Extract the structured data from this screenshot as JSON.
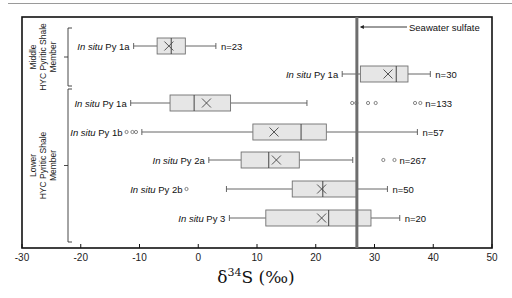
{
  "chart_data": {
    "type": "boxplot",
    "orientation": "horizontal",
    "title": "",
    "xlabel": "δ34S (‰)",
    "xlabel_parts": {
      "delta": "δ",
      "sup": "34",
      "rest": "S (‰)"
    },
    "ylabel": "",
    "xlim": [
      -30,
      50
    ],
    "xticks": [
      -30,
      -20,
      -10,
      0,
      10,
      20,
      30,
      40,
      50
    ],
    "grid": false,
    "reference_line": {
      "label": "Seawater sulfate",
      "x": 27
    },
    "groups": [
      {
        "label_lines": [
          "Middle",
          "HYC Pyritic Shale",
          "Member"
        ],
        "rows": [
          0,
          1
        ]
      },
      {
        "label_lines": [
          "Lower",
          "HYC Pyritic Shale",
          "Member"
        ],
        "rows": [
          2,
          3,
          4,
          5,
          6
        ]
      }
    ],
    "series": [
      {
        "name_italic": "In situ",
        "name_rest": " Py 1a",
        "group": "Middle",
        "n_label": "n=23",
        "whisker_low": -11,
        "q1": -7,
        "median": -4.6,
        "q3": -2.2,
        "whisker_high": 3,
        "mean": -5,
        "outliers": []
      },
      {
        "name_italic": "In situ",
        "name_rest": " Py 1a",
        "group": "Middle",
        "n_label": "n=30",
        "whisker_low": 24.5,
        "q1": 27.6,
        "median": 33.7,
        "q3": 35.7,
        "whisker_high": 39.5,
        "mean": 32.3,
        "outliers": []
      },
      {
        "name_italic": "In situ",
        "name_rest": " Py 1a",
        "group": "Lower",
        "n_label": "n=133",
        "whisker_low": -11.5,
        "q1": -4.8,
        "median": -0.7,
        "q3": 5.5,
        "whisker_high": 18.5,
        "mean": 1.4,
        "outliers": [
          26.2,
          26.9,
          28.9,
          30.2,
          36.9,
          37.8
        ]
      },
      {
        "name_italic": "In situ",
        "name_rest": " Py 1b",
        "group": "Lower",
        "n_label": "n=57",
        "whisker_low": -9.6,
        "q1": 9.3,
        "median": 17.5,
        "q3": 21.8,
        "whisker_high": 37.3,
        "mean": 12.9,
        "outliers": [
          -12.2,
          -11.2,
          -10.6
        ]
      },
      {
        "name_italic": "In situ",
        "name_rest": " Py 2a",
        "group": "Lower",
        "n_label": "n=267",
        "whisker_low": 1.8,
        "q1": 7.3,
        "median": 12.0,
        "q3": 17.2,
        "whisker_high": 26.3,
        "mean": 13.3,
        "outliers": [
          31.5,
          33.4
        ]
      },
      {
        "name_italic": "In situ",
        "name_rest": " Py 2b",
        "group": "Lower",
        "n_label": "n=50",
        "whisker_low": 4.8,
        "q1": 16.0,
        "median": 21.2,
        "q3": 27.0,
        "whisker_high": 32.2,
        "mean": 21.0,
        "outliers": [
          -2
        ]
      },
      {
        "name_italic": "In situ",
        "name_rest": " Py 3",
        "group": "Lower",
        "n_label": "n=20",
        "whisker_low": 5.3,
        "q1": 11.5,
        "median": 22.2,
        "q3": 29.4,
        "whisker_high": 34.3,
        "mean": 21.0,
        "outliers": []
      }
    ]
  },
  "colors": {
    "box_fill": "#e6e6e6",
    "box_stroke": "#707070",
    "whisker": "#555555",
    "seawater_line": "#6e6e6e",
    "frame": "#111111"
  }
}
